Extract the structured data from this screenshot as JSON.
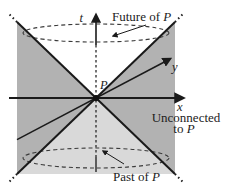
{
  "labels": {
    "axis_t": "t",
    "axis_x": "x",
    "axis_y": "y",
    "origin_point": "P",
    "future_prefix": "Future of ",
    "future_point": "P",
    "past_prefix": "Past of ",
    "past_point": "P",
    "unconnected_line1": "Unconnected",
    "unconnected_line2_prefix": "to ",
    "unconnected_line2_point": "P"
  },
  "colors": {
    "region_unconnected": "#b2b2b2",
    "region_past": "#d9d9d9",
    "region_future": "#ffffff",
    "line": "#1a1a1a",
    "text": "#1c1c1c"
  }
}
